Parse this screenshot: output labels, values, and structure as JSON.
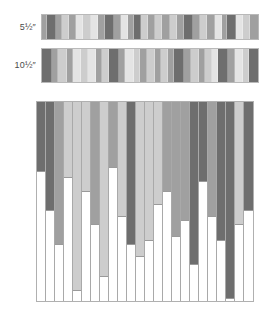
{
  "figure": {
    "title": "",
    "background": "#ffffff"
  },
  "palette": {
    "dark": "#6e6e6e",
    "medium": "#a0a0a0",
    "light": "#cdcdcd",
    "pale": "#e4e4e4",
    "white": "#ffffff",
    "outline": "#b0b0b0",
    "label_color": "#4a4a4a"
  },
  "strips": [
    {
      "label": "5½″",
      "name": "strip-5-5-inch",
      "segments": [
        {
          "tone": "medium",
          "width": 3
        },
        {
          "tone": "dark",
          "width": 5
        },
        {
          "tone": "medium",
          "width": 3
        },
        {
          "tone": "light",
          "width": 4
        },
        {
          "tone": "medium",
          "width": 4
        },
        {
          "tone": "pale",
          "width": 4
        },
        {
          "tone": "light",
          "width": 4
        },
        {
          "tone": "pale",
          "width": 4
        },
        {
          "tone": "medium",
          "width": 4
        },
        {
          "tone": "dark",
          "width": 5
        },
        {
          "tone": "medium",
          "width": 4
        },
        {
          "tone": "pale",
          "width": 4
        },
        {
          "tone": "medium",
          "width": 3
        },
        {
          "tone": "dark",
          "width": 4
        },
        {
          "tone": "light",
          "width": 4
        },
        {
          "tone": "medium",
          "width": 4
        },
        {
          "tone": "light",
          "width": 4
        },
        {
          "tone": "medium",
          "width": 4
        },
        {
          "tone": "light",
          "width": 4
        },
        {
          "tone": "medium",
          "width": 4
        },
        {
          "tone": "dark",
          "width": 5
        },
        {
          "tone": "medium",
          "width": 4
        },
        {
          "tone": "light",
          "width": 4
        },
        {
          "tone": "medium",
          "width": 4
        },
        {
          "tone": "pale",
          "width": 4
        },
        {
          "tone": "medium",
          "width": 3
        },
        {
          "tone": "dark",
          "width": 5
        },
        {
          "tone": "pale",
          "width": 4
        },
        {
          "tone": "light",
          "width": 4
        },
        {
          "tone": "medium",
          "width": 4
        }
      ]
    },
    {
      "label": "10½″",
      "name": "strip-10-5-inch",
      "segments": [
        {
          "tone": "dark",
          "width": 6
        },
        {
          "tone": "medium",
          "width": 4
        },
        {
          "tone": "light",
          "width": 5
        },
        {
          "tone": "medium",
          "width": 4
        },
        {
          "tone": "pale",
          "width": 5
        },
        {
          "tone": "light",
          "width": 4
        },
        {
          "tone": "pale",
          "width": 5
        },
        {
          "tone": "medium",
          "width": 4
        },
        {
          "tone": "light",
          "width": 4
        },
        {
          "tone": "dark",
          "width": 6
        },
        {
          "tone": "medium",
          "width": 4
        },
        {
          "tone": "pale",
          "width": 5
        },
        {
          "tone": "light",
          "width": 4
        },
        {
          "tone": "medium",
          "width": 4
        },
        {
          "tone": "light",
          "width": 5
        },
        {
          "tone": "medium",
          "width": 4
        },
        {
          "tone": "light",
          "width": 4
        },
        {
          "tone": "medium",
          "width": 4
        },
        {
          "tone": "dark",
          "width": 6
        },
        {
          "tone": "medium",
          "width": 4
        },
        {
          "tone": "light",
          "width": 5
        },
        {
          "tone": "medium",
          "width": 4
        },
        {
          "tone": "light",
          "width": 4
        },
        {
          "tone": "pale",
          "width": 4
        },
        {
          "tone": "dark",
          "width": 6
        },
        {
          "tone": "medium",
          "width": 4
        },
        {
          "tone": "pale",
          "width": 5
        },
        {
          "tone": "light",
          "width": 4
        },
        {
          "tone": "dark",
          "width": 5
        }
      ]
    }
  ],
  "chart_data": {
    "type": "bar",
    "title": "",
    "xlabel": "",
    "ylabel": "",
    "ylim": [
      0,
      100
    ],
    "grid": false,
    "legend": null,
    "categories": [
      "1",
      "2",
      "3",
      "4",
      "5",
      "6",
      "7",
      "8",
      "9",
      "10",
      "11",
      "12",
      "13",
      "14",
      "15",
      "16",
      "17",
      "18",
      "19",
      "20",
      "21",
      "22",
      "23",
      "24"
    ],
    "values": [
      35,
      55,
      72,
      38,
      95,
      45,
      62,
      88,
      33,
      58,
      72,
      78,
      70,
      52,
      45,
      68,
      60,
      82,
      40,
      58,
      70,
      99,
      62,
      55
    ],
    "tones": [
      "dark",
      "dark",
      "medium",
      "light",
      "light",
      "light",
      "medium",
      "light",
      "medium",
      "light",
      "dark",
      "light",
      "light",
      "light",
      "medium",
      "medium",
      "medium",
      "dark",
      "dark",
      "medium",
      "dark",
      "dark",
      "light",
      "dark"
    ]
  }
}
